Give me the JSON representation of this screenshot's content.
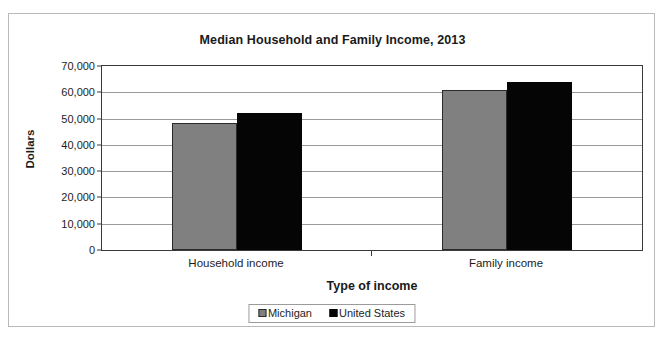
{
  "chart_data": {
    "type": "bar",
    "title": "Median Household and Family Income, 2013",
    "xlabel": "Type of income",
    "ylabel": "Dollars",
    "categories": [
      "Household income",
      "Family income"
    ],
    "series": [
      {
        "name": "Michigan",
        "color": "#808080",
        "values": [
          48411,
          61000
        ]
      },
      {
        "name": "United States",
        "color": "#000000",
        "values": [
          52250,
          64030
        ]
      }
    ],
    "ylim": [
      0,
      70000
    ],
    "yticks": [
      0,
      10000,
      20000,
      30000,
      40000,
      50000,
      60000,
      70000
    ],
    "ytick_labels": [
      "0",
      "10,000",
      "20,000",
      "30,000",
      "40,000",
      "50,000",
      "60,000",
      "70,000"
    ],
    "grid": true,
    "legend_position": "bottom",
    "legend": [
      {
        "label": "Michigan",
        "swatch": "gray-square-icon"
      },
      {
        "label": "United States",
        "swatch": "black-square-icon"
      }
    ]
  }
}
